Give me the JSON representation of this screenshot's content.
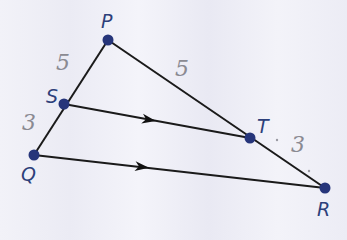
{
  "diagram": {
    "points": {
      "P": {
        "label": "P",
        "x": 108,
        "y": 40
      },
      "S": {
        "label": "S",
        "x": 64,
        "y": 104
      },
      "Q": {
        "label": "Q",
        "x": 34,
        "y": 155
      },
      "T": {
        "label": "T",
        "x": 250,
        "y": 138
      },
      "R": {
        "label": "R",
        "x": 325,
        "y": 188
      }
    },
    "segments": [
      {
        "from": "P",
        "to": "Q"
      },
      {
        "from": "P",
        "to": "R"
      },
      {
        "from": "S",
        "to": "T",
        "parallel_marker": true
      },
      {
        "from": "Q",
        "to": "R",
        "parallel_marker": true
      }
    ],
    "handwritten_labels": {
      "PS": "5",
      "SQ": "3",
      "PT": "5",
      "TR": "3"
    },
    "colors": {
      "point": "#26357a",
      "line": "#1a1a1a",
      "label": "#2d3f7a",
      "handwriting": "#8a8a92"
    }
  }
}
